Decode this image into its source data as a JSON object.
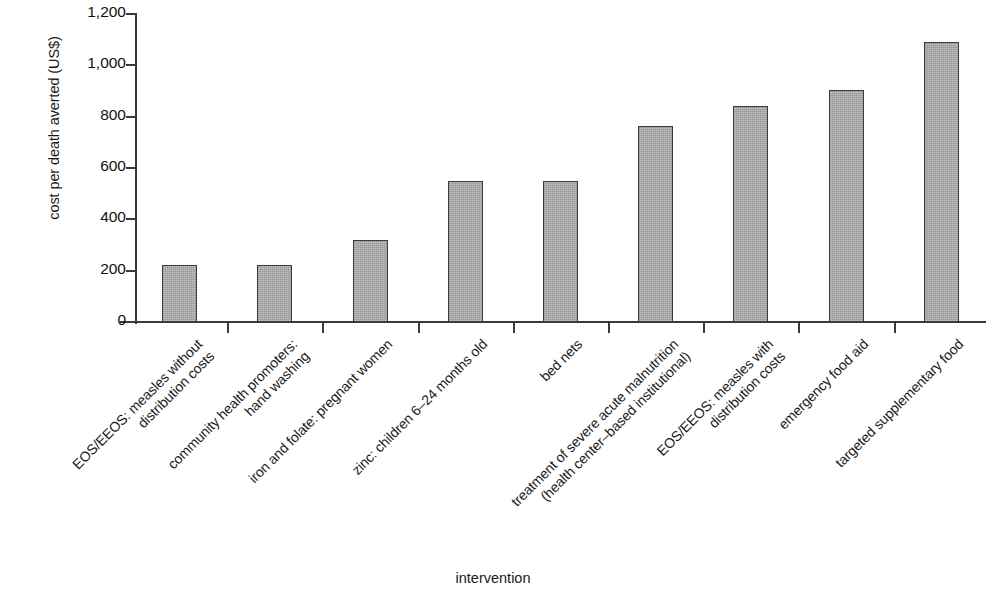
{
  "chart_data": {
    "type": "bar",
    "title": "",
    "xlabel": "intervention",
    "ylabel": "cost per death averted (US$)",
    "ylim": [
      0,
      1200
    ],
    "ytick_values": [
      0,
      200,
      400,
      600,
      800,
      1000,
      1200
    ],
    "ytick_labels": [
      "0",
      "200",
      "400",
      "600",
      "800",
      "1,000",
      "1,200"
    ],
    "grid": false,
    "legend": null,
    "bar_color": "#a8a8a8",
    "bar_edge_color": "#3b3b3b",
    "categories": [
      "EOS/EEOS: measles without distribution costs",
      "community health promoters: hand washing",
      "iron and folate: pregnant women",
      "zinc: children 6–24 months old",
      "bed nets",
      "treatment of severe acute malnutrition (health center–based institutional)",
      "EOS/EEOS: measles with distribution costs",
      "emergency food aid",
      "targeted supplementary food"
    ],
    "category_lines": [
      [
        "EOS/EEOS: measles without",
        "distribution costs"
      ],
      [
        "community health promoters:",
        "hand washing"
      ],
      [
        "iron and folate: pregnant women",
        ""
      ],
      [
        "zinc: children 6–24 months old",
        ""
      ],
      [
        "bed nets",
        ""
      ],
      [
        "treatment of severe acute malnutrition",
        "(health center–based institutional)"
      ],
      [
        "EOS/EEOS: measles with",
        "distribution costs"
      ],
      [
        "emergency food aid",
        ""
      ],
      [
        "targeted supplementary food",
        ""
      ]
    ],
    "values": [
      222,
      222,
      320,
      548,
      548,
      762,
      842,
      902,
      1090
    ]
  }
}
